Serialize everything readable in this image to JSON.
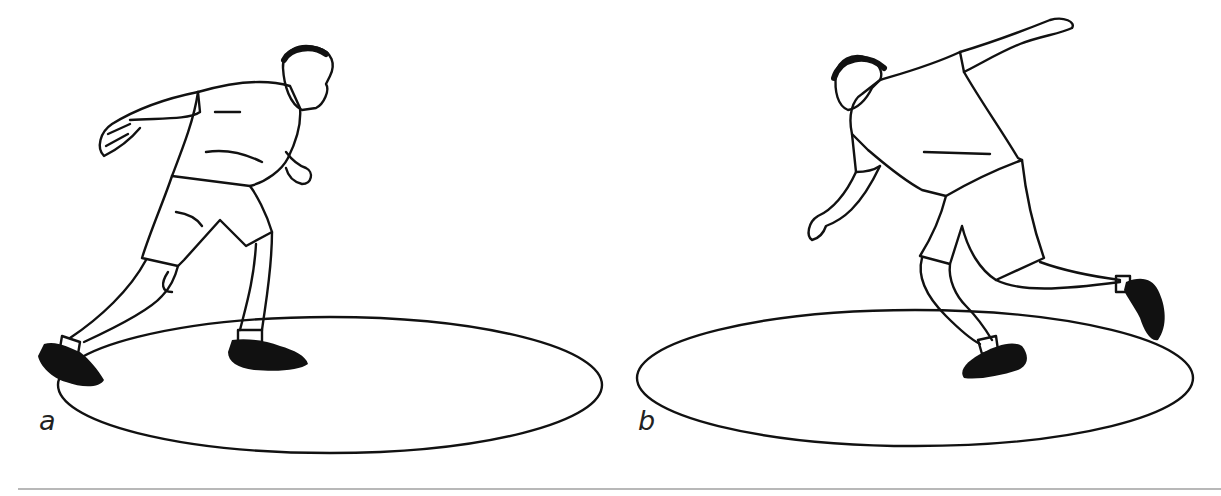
{
  "figure": {
    "panels": [
      {
        "label": "a",
        "description": "Discus thrower in wind-up stance with discus held behind, entering circle"
      },
      {
        "label": "b",
        "description": "Discus thrower turning through, discus arm extended back, trailing leg lifted"
      }
    ],
    "colors": {
      "line": "#111111",
      "rule": "#b8b8b8",
      "background": "#ffffff"
    }
  }
}
